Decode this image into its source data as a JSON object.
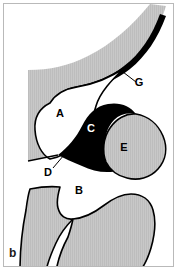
{
  "figure": {
    "panel_letter": "b",
    "type": "anatomical-line-diagram",
    "background_color": "#ffffff",
    "frame_color": "#b9b9b9",
    "fill_colors": {
      "tissue_gray": "#c6c6c6",
      "solid_black": "#000000",
      "lumen_white": "#ffffff",
      "outline": "#000000"
    },
    "labels": [
      {
        "id": "label-a",
        "text": "A",
        "x": 60,
        "y": 117,
        "color": "#000000",
        "region": "white-lumen-upper-left",
        "has_leader_line": false
      },
      {
        "id": "label-b",
        "text": "B",
        "x": 79,
        "y": 194,
        "color": "#000000",
        "region": "white-space-lower",
        "has_leader_line": false
      },
      {
        "id": "label-c",
        "text": "C",
        "x": 91,
        "y": 132,
        "color": "#ffffff",
        "region": "black-mass-center",
        "has_leader_line": false
      },
      {
        "id": "label-d",
        "text": "D",
        "x": 48,
        "y": 176,
        "color": "#000000",
        "region": "narrow-junction",
        "has_leader_line": true,
        "leader_line": {
          "x1": 53,
          "y1": 168,
          "x2": 64,
          "y2": 155
        }
      },
      {
        "id": "label-e",
        "text": "E",
        "x": 124,
        "y": 151,
        "color": "#000000",
        "region": "gray-blob-right",
        "has_leader_line": false
      },
      {
        "id": "label-g",
        "text": "G",
        "x": 139,
        "y": 86,
        "color": "#000000",
        "region": "black-crescent-upper",
        "has_leader_line": true,
        "leader_line": {
          "x1": 136,
          "y1": 82,
          "x2": 123,
          "y2": 72
        }
      }
    ],
    "regions": [
      {
        "id": "upper-gray-band",
        "fill": "tissue_gray",
        "description": "curved gray band sweeping from upper right down the left side"
      },
      {
        "id": "black-crescent-g",
        "fill": "solid_black",
        "description": "black crescent along lower edge of upper gray band"
      },
      {
        "id": "white-lumen-a",
        "fill": "lumen_white",
        "description": "large white rounded space labeled A"
      },
      {
        "id": "black-mass-c",
        "fill": "solid_black",
        "description": "black mass labeled C, tapering to the left toward D"
      },
      {
        "id": "gray-blob-e",
        "fill": "tissue_gray",
        "description": "rounded gray blob labeled E with black outline"
      },
      {
        "id": "lower-left-gray",
        "fill": "tissue_gray",
        "description": "lower-left gray crescent with S-curve boundary"
      },
      {
        "id": "lower-right-gray",
        "fill": "tissue_gray",
        "description": "lower-right gray mass with rounded top"
      }
    ]
  }
}
